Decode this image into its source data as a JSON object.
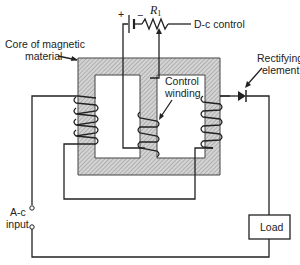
{
  "diagram": {
    "type": "magnetic-amplifier-schematic",
    "labels": {
      "core": "Core of magnetic material",
      "core_line1": "Core of magnetic",
      "core_line2": "material",
      "resistor": "R",
      "resistor_sub": "1",
      "dc_control": "D-c control",
      "control_winding_line1": "Control",
      "control_winding_line2": "winding",
      "rectifier_line1": "Rectifying",
      "rectifier_line2": "element",
      "ac_input_line1": "A-c",
      "ac_input_line2": "input",
      "load": "Load",
      "battery_plus": "+",
      "battery_minus": "−"
    },
    "components": [
      {
        "id": "core",
        "label": "Core of magnetic material",
        "kind": "three-leg core (hatched)"
      },
      {
        "id": "battery",
        "label": "+ / −",
        "kind": "d-c source"
      },
      {
        "id": "r1",
        "label": "R1",
        "kind": "variable resistor"
      },
      {
        "id": "left-winding",
        "kind": "a-c winding",
        "turns": 4
      },
      {
        "id": "control-winding",
        "label": "Control winding",
        "kind": "d-c winding",
        "turns": 3
      },
      {
        "id": "right-winding",
        "kind": "a-c winding",
        "turns": 4
      },
      {
        "id": "diode",
        "label": "Rectifying element",
        "kind": "rectifier"
      },
      {
        "id": "load",
        "label": "Load",
        "kind": "load box"
      },
      {
        "id": "ac-input",
        "label": "A-c input",
        "kind": "two terminals"
      }
    ],
    "colors": {
      "line": "#222222",
      "core_fill": "#bdbdbd",
      "background": "#ffffff"
    }
  }
}
